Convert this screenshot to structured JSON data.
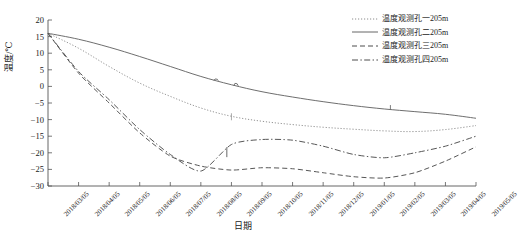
{
  "chart_data": {
    "type": "line",
    "title": "",
    "xlabel": "日期",
    "ylabel": "温度/℃",
    "ylim": [
      -30,
      20
    ],
    "yticks": [
      20,
      15,
      10,
      5,
      0,
      -5,
      -10,
      -15,
      -20,
      -25,
      -30
    ],
    "grid": false,
    "legend_position": "top-right",
    "categories": [
      "2018/03/05",
      "2018/04/05",
      "2018/05/05",
      "2018/06/05",
      "2018/07/05",
      "2018/08/05",
      "2018/09/05",
      "2018/10/05",
      "2018/11/05",
      "2018/12/05",
      "2019/01/05",
      "2019/02/05",
      "2019/03/05",
      "2019/04/05",
      "2019/05/05"
    ],
    "series": [
      {
        "name": "温度观测孔一205m",
        "style": "dotted",
        "color": "#8c8c8c",
        "values": [
          16.0,
          11.5,
          6.0,
          1.0,
          -3.0,
          -6.5,
          -9.0,
          -10.5,
          -11.5,
          -12.3,
          -12.9,
          -13.4,
          -13.6,
          -13.0,
          -11.8
        ]
      },
      {
        "name": "温度观测孔二205m",
        "style": "solid",
        "color": "#666666",
        "values": [
          16.0,
          14.2,
          11.8,
          9.0,
          6.0,
          3.0,
          0.5,
          -1.6,
          -3.2,
          -4.6,
          -5.8,
          -6.8,
          -7.6,
          -8.4,
          -9.6
        ]
      },
      {
        "name": "温度观测孔三205m",
        "style": "dashed",
        "color": "#4d4d4d",
        "values": [
          16.0,
          4.0,
          -5.0,
          -14.0,
          -21.0,
          -24.0,
          -25.2,
          -24.5,
          -24.8,
          -26.0,
          -27.2,
          -27.6,
          -26.0,
          -22.5,
          -18.2
        ]
      },
      {
        "name": "温度观测孔四205m",
        "style": "dashdot",
        "color": "#4d4d4d",
        "values": [
          16.0,
          4.5,
          -4.0,
          -13.0,
          -20.5,
          -25.5,
          -17.5,
          -16.0,
          -16.2,
          -18.0,
          -20.5,
          -21.5,
          -20.0,
          -18.0,
          -15.0
        ]
      }
    ],
    "annotations": [
      {
        "label": "spike",
        "x": "2018/08/20",
        "series": "温度观测孔二205m"
      },
      {
        "label": "spike",
        "x": "2018/09/10",
        "series": "温度观测孔二205m"
      }
    ]
  }
}
